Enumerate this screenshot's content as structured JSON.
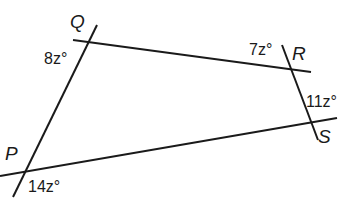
{
  "diagram": {
    "type": "quadrilateral-with-extended-sides",
    "colors": {
      "line": "#1a1a1a",
      "text": "#1a1a1a",
      "background": "#ffffff"
    },
    "vertices": [
      {
        "id": "Q",
        "label": "Q",
        "x": 88,
        "y": 42,
        "label_x": 70,
        "label_y": 28
      },
      {
        "id": "R",
        "label": "R",
        "x": 289,
        "y": 69,
        "label_x": 292,
        "label_y": 60
      },
      {
        "id": "S",
        "label": "S",
        "x": 311,
        "y": 125,
        "label_x": 318,
        "label_y": 143
      },
      {
        "id": "P",
        "label": "P",
        "x": 23,
        "y": 172,
        "label_x": 5,
        "label_y": 160
      }
    ],
    "lines": [
      {
        "id": "line-PQ",
        "x1": 97,
        "y1": 25,
        "x2": 13,
        "y2": 197
      },
      {
        "id": "line-QR",
        "x1": 73,
        "y1": 40,
        "x2": 311,
        "y2": 72
      },
      {
        "id": "line-RS",
        "x1": 282,
        "y1": 45,
        "x2": 318,
        "y2": 140
      },
      {
        "id": "line-PS",
        "x1": 0,
        "y1": 176,
        "x2": 337,
        "y2": 118
      }
    ],
    "angle_labels": [
      {
        "id": "angle-Q",
        "vertex": "Q",
        "text": "8z°",
        "x": 44,
        "y": 64
      },
      {
        "id": "angle-R",
        "vertex": "R",
        "text": "7z°",
        "x": 249,
        "y": 55
      },
      {
        "id": "angle-S",
        "vertex": "S",
        "text": "11z°",
        "x": 306,
        "y": 107
      },
      {
        "id": "angle-P",
        "vertex": "P",
        "text": "14z°",
        "x": 28,
        "y": 192
      }
    ]
  }
}
